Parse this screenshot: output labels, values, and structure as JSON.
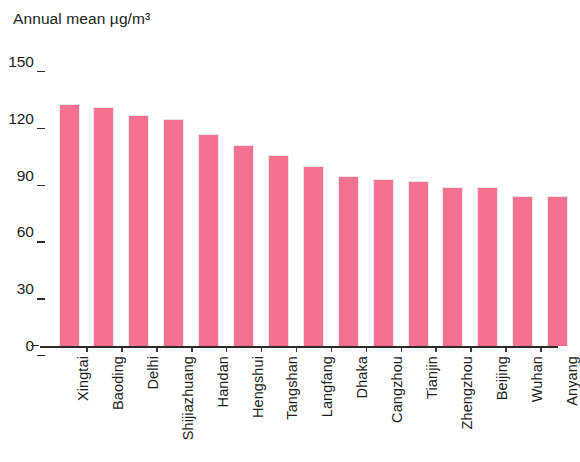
{
  "chart_data": {
    "type": "bar",
    "title": "Annual mean µg/m³",
    "xlabel": "",
    "ylabel": "Annual mean µg/m³",
    "ylim": [
      0,
      150
    ],
    "yticks": [
      0,
      30,
      60,
      90,
      120,
      150
    ],
    "grid": false,
    "legend": false,
    "bar_color": "#f4718f",
    "bar_edge_color": "#e8e8e8",
    "axis_color": "#2b2b2b",
    "categories": [
      "Xingtai",
      "Baoding",
      "Delhi",
      "Shijiazhuang",
      "Handan",
      "Hengshui",
      "Tangshan",
      "Langfang",
      "Dhaka",
      "Cangzhou",
      "Tianjin",
      "Zhengzhou",
      "Beijing",
      "Wuhan",
      "Anyang"
    ],
    "values": [
      128,
      126,
      122,
      120,
      112,
      106,
      101,
      95,
      90,
      88,
      87,
      84,
      84,
      79,
      79
    ],
    "series": [
      {
        "name": "Annual mean PM concentration",
        "values": [
          128,
          126,
          122,
          120,
          112,
          106,
          101,
          95,
          90,
          88,
          87,
          84,
          84,
          79,
          79
        ]
      }
    ]
  },
  "axis": {
    "title": "Annual mean µg/m³",
    "tick_labels": [
      "150",
      "120",
      "90",
      "60",
      "30",
      "0"
    ]
  }
}
